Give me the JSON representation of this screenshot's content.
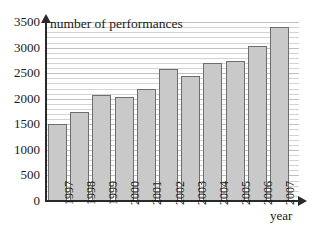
{
  "chart_data": {
    "type": "bar",
    "title": "",
    "categories": [
      "1997",
      "1998",
      "1999",
      "2000",
      "2001",
      "2002",
      "2003",
      "2004",
      "2005",
      "2006",
      "2007"
    ],
    "values": [
      1500,
      1750,
      2080,
      2030,
      2190,
      2590,
      2440,
      2690,
      2740,
      3040,
      3410
    ],
    "xlabel": "year",
    "ylabel": "number of performances",
    "ylim": [
      0,
      3500
    ],
    "ytick_labels": [
      "0",
      "500",
      "1000",
      "1500",
      "2000",
      "2500",
      "3000",
      "3500"
    ],
    "ytick_values": [
      0,
      500,
      1000,
      1500,
      2000,
      2500,
      3000,
      3500
    ],
    "minor_tick_step": 100,
    "grid": true,
    "legend": "none",
    "bar_fill_color": "#c9c9c9",
    "bar_border_color": "#6e6e6e",
    "axis_color": "#2a2a2a",
    "gridline_color": "#d3d3d3",
    "background_color": "#ffffff"
  },
  "axes": {
    "y_axis_title": "number of performances",
    "x_axis_title": "year"
  }
}
